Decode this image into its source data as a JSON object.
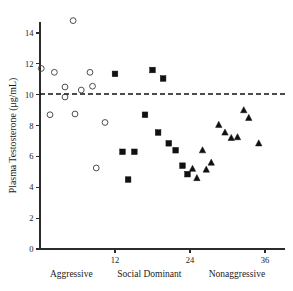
{
  "chart_data": {
    "type": "scatter",
    "title": "",
    "xlabel": "",
    "ylabel": "Plasma Testosterone (μg/mL)",
    "xlim": [
      0,
      39
    ],
    "ylim": [
      0,
      15.2
    ],
    "grid": false,
    "legend_position": "none",
    "x_ticks": [
      12,
      24,
      36
    ],
    "x_tick_labels": [
      "12",
      "24",
      "36"
    ],
    "y_ticks": [
      0,
      2,
      4,
      6,
      8,
      10,
      12,
      14
    ],
    "y_tick_labels": [
      "0",
      "2",
      "4",
      "6",
      "8",
      "10",
      "12",
      "14"
    ],
    "annotations": [
      {
        "name": "reference-line",
        "type": "hline",
        "y": 10.05,
        "style": "dashed",
        "label": ""
      }
    ],
    "group_labels": [
      {
        "name": "aggressive",
        "text": "Aggressive",
        "x_center": 5.0
      },
      {
        "name": "social-dominant",
        "text": "Social Dominant",
        "x_center": 17.5
      },
      {
        "name": "nonaggressive",
        "text": "Nonaggressive",
        "x_center": 31.5
      }
    ],
    "series": [
      {
        "name": "Aggressive",
        "marker": "open-circle",
        "color": "#3a3a3a",
        "points": [
          {
            "x": 0.2,
            "y": 11.7
          },
          {
            "x": 1.6,
            "y": 8.7
          },
          {
            "x": 2.3,
            "y": 11.45
          },
          {
            "x": 4.0,
            "y": 10.5
          },
          {
            "x": 4.0,
            "y": 9.85
          },
          {
            "x": 5.3,
            "y": 14.8
          },
          {
            "x": 5.6,
            "y": 8.75
          },
          {
            "x": 6.6,
            "y": 10.3
          },
          {
            "x": 8.0,
            "y": 11.45
          },
          {
            "x": 8.4,
            "y": 10.55
          },
          {
            "x": 9.0,
            "y": 5.25
          },
          {
            "x": 10.4,
            "y": 8.2
          }
        ]
      },
      {
        "name": "Social Dominant",
        "marker": "filled-square",
        "color": "#111111",
        "points": [
          {
            "x": 12.0,
            "y": 11.35
          },
          {
            "x": 13.2,
            "y": 6.3
          },
          {
            "x": 14.1,
            "y": 4.5
          },
          {
            "x": 15.1,
            "y": 6.3
          },
          {
            "x": 16.8,
            "y": 8.7
          },
          {
            "x": 18.0,
            "y": 11.6
          },
          {
            "x": 18.9,
            "y": 7.55
          },
          {
            "x": 19.7,
            "y": 11.05
          },
          {
            "x": 20.6,
            "y": 6.85
          },
          {
            "x": 21.7,
            "y": 6.4
          },
          {
            "x": 22.8,
            "y": 5.4
          },
          {
            "x": 23.6,
            "y": 4.85
          }
        ]
      },
      {
        "name": "Nonaggressive",
        "marker": "filled-triangle",
        "color": "#111111",
        "points": [
          {
            "x": 24.4,
            "y": 5.2
          },
          {
            "x": 25.1,
            "y": 4.6
          },
          {
            "x": 26.0,
            "y": 6.4
          },
          {
            "x": 26.6,
            "y": 5.15
          },
          {
            "x": 27.4,
            "y": 5.6
          },
          {
            "x": 28.6,
            "y": 8.05
          },
          {
            "x": 29.6,
            "y": 7.55
          },
          {
            "x": 30.6,
            "y": 7.2
          },
          {
            "x": 31.6,
            "y": 7.25
          },
          {
            "x": 32.6,
            "y": 9.0
          },
          {
            "x": 33.4,
            "y": 8.5
          },
          {
            "x": 35.0,
            "y": 6.85
          }
        ]
      }
    ]
  }
}
